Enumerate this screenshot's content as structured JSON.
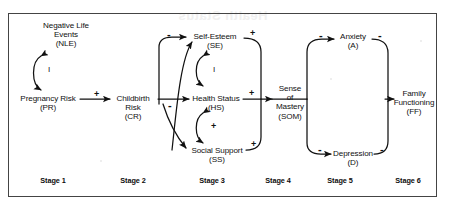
{
  "figure": {
    "background": "#ffffff",
    "line_color": "#111111",
    "frame": {
      "x": 8,
      "y": 13,
      "width": 429,
      "height": 184
    }
  },
  "watermark": {
    "text": "Health Status",
    "visible": true
  },
  "nodes": [
    {
      "id": "NLE",
      "name": "negative-life-events",
      "lines": [
        "Negative Life",
        "Events",
        "(NLE)"
      ],
      "x": 66,
      "y": 26,
      "stage": 1
    },
    {
      "id": "PR",
      "name": "pregnancy-risk",
      "lines": [
        "Pregnancy Risk",
        "(PR)"
      ],
      "x": 50,
      "y": 98,
      "stage": 1
    },
    {
      "id": "CR",
      "name": "childbirth-risk",
      "lines": [
        "Childbirth",
        "Risk",
        "(CR)"
      ],
      "x": 133,
      "y": 98,
      "stage": 2
    },
    {
      "id": "SE",
      "name": "self-esteem",
      "lines": [
        "Self-Esteem",
        "(SE)"
      ],
      "x": 215,
      "y": 36,
      "stage": 3
    },
    {
      "id": "HS",
      "name": "health-status",
      "lines": [
        "Health Status",
        "(HS)"
      ],
      "x": 215,
      "y": 98,
      "stage": 3
    },
    {
      "id": "SS",
      "name": "social-support",
      "lines": [
        "Social Support",
        "(SS)"
      ],
      "x": 215,
      "y": 152,
      "stage": 3
    },
    {
      "id": "SOM",
      "name": "sense-of-mastery",
      "lines": [
        "Sense",
        "of",
        "Mastery",
        "(SOM)"
      ],
      "x": 290,
      "y": 92,
      "stage": 4
    },
    {
      "id": "A",
      "name": "anxiety",
      "lines": [
        "Anxiety",
        "(A)"
      ],
      "x": 349,
      "y": 36,
      "stage": 5
    },
    {
      "id": "D",
      "name": "depression",
      "lines": [
        "Depression",
        "(D)"
      ],
      "x": 349,
      "y": 148,
      "stage": 5
    },
    {
      "id": "FF",
      "name": "family-functioning",
      "lines": [
        "Family",
        "Functioning",
        "(FF)"
      ],
      "x": 411,
      "y": 92,
      "stage": 6
    }
  ],
  "edges": [
    {
      "from": "PR",
      "to": "CR",
      "sign": "+",
      "name": "edge-pr-to-cr"
    },
    {
      "from": "NLE",
      "to": "PR-CR-path",
      "sign": "I",
      "name": "edge-nle-interaction",
      "type": "interaction"
    },
    {
      "from": "CR",
      "to": "SE",
      "sign": "-",
      "name": "edge-cr-to-se"
    },
    {
      "from": "CR",
      "to": "HS",
      "sign": "-",
      "name": "edge-cr-to-hs"
    },
    {
      "from": "CR",
      "to": "SS",
      "sign": "-",
      "name": "edge-cr-to-ss"
    },
    {
      "from": "SS",
      "to": "SE",
      "sign": "",
      "name": "edge-ss-to-se"
    },
    {
      "from": "SE",
      "to": "HS",
      "sign": "I",
      "name": "edge-se-hs-interaction",
      "type": "interaction"
    },
    {
      "from": "HS",
      "to": "SS",
      "sign": "+",
      "name": "edge-hs-ss-interaction",
      "type": "interaction"
    },
    {
      "from": "SE",
      "to": "SOM",
      "sign": "+",
      "name": "edge-se-to-som"
    },
    {
      "from": "HS",
      "to": "SOM",
      "sign": "+",
      "name": "edge-hs-to-som"
    },
    {
      "from": "SS",
      "to": "SOM",
      "sign": "+",
      "name": "edge-ss-to-som"
    },
    {
      "from": "SOM",
      "to": "A",
      "sign": "-",
      "name": "edge-som-to-anxiety"
    },
    {
      "from": "SOM",
      "to": "D",
      "sign": "-",
      "name": "edge-som-to-depression"
    },
    {
      "from": "A",
      "to": "FF",
      "sign": "-",
      "name": "edge-anxiety-to-ff"
    },
    {
      "from": "D",
      "to": "FF",
      "sign": "-",
      "name": "edge-depression-to-ff"
    }
  ],
  "sign_labels": [
    {
      "id": "s-pr-cr",
      "text": "+",
      "x": 94,
      "y": 92,
      "name": "sign-pr-to-cr"
    },
    {
      "id": "s-nle",
      "text": "I",
      "x": 48,
      "y": 66,
      "name": "sign-nle-interaction",
      "style": "iloop"
    },
    {
      "id": "s-cr-se",
      "text": "-",
      "x": 167,
      "y": 31,
      "name": "sign-cr-to-se"
    },
    {
      "id": "s-cr-hs",
      "text": "-",
      "x": 168,
      "y": 103,
      "name": "sign-cr-to-hs"
    },
    {
      "id": "s-se-hs",
      "text": "I",
      "x": 213,
      "y": 66,
      "name": "sign-se-hs-interaction",
      "style": "iloop"
    },
    {
      "id": "s-hs-ss",
      "text": "+",
      "x": 212,
      "y": 124,
      "name": "sign-hs-ss-interaction"
    },
    {
      "id": "s-se-som",
      "text": "+",
      "x": 253,
      "y": 32,
      "name": "sign-se-to-som"
    },
    {
      "id": "s-hs-som",
      "text": "+",
      "x": 250,
      "y": 92,
      "name": "sign-hs-to-som"
    },
    {
      "id": "s-ss-som",
      "text": "+",
      "x": 253,
      "y": 143,
      "name": "sign-ss-to-som"
    },
    {
      "id": "s-som-a",
      "text": "-",
      "x": 317,
      "y": 33,
      "name": "sign-som-to-anxiety"
    },
    {
      "id": "s-a-ff",
      "text": "-",
      "x": 379,
      "y": 33,
      "name": "sign-anxiety-to-ff"
    },
    {
      "id": "s-som-d",
      "text": "-",
      "x": 317,
      "y": 146,
      "name": "sign-som-to-depression"
    },
    {
      "id": "s-d-ff",
      "text": "-",
      "x": 381,
      "y": 146,
      "name": "sign-depression-to-ff"
    }
  ],
  "stages": [
    {
      "label": "Stage 1",
      "x": 53,
      "y": 178,
      "name": "stage-label-1"
    },
    {
      "label": "Stage 2",
      "x": 133,
      "y": 178,
      "name": "stage-label-2"
    },
    {
      "label": "Stage 3",
      "x": 212,
      "y": 178,
      "name": "stage-label-3"
    },
    {
      "label": "Stage 4",
      "x": 278,
      "y": 178,
      "name": "stage-label-4"
    },
    {
      "label": "Stage 5",
      "x": 340,
      "y": 178,
      "name": "stage-label-5"
    },
    {
      "label": "Stage 6",
      "x": 408,
      "y": 178,
      "name": "stage-label-6"
    }
  ]
}
